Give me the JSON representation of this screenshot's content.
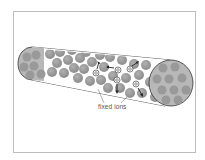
{
  "diagram": {
    "type": "cylindrical pore with fixed ions and mobile ions",
    "label": "fixed ions",
    "colors": {
      "frame_border": "#bdbdbd",
      "sphere_fill": "#9a9a9a",
      "sphere_shade": "#8a8a8a",
      "end_cap_fill": "#b8b8b8",
      "outline": "#333333",
      "ion_marker": "#ffffff",
      "arrow": "#222222",
      "label_text": "#555555"
    },
    "mobile_ions": [
      {
        "x": 96,
        "y": 73,
        "arrow": "up"
      },
      {
        "x": 118,
        "y": 70,
        "arrow": "left"
      },
      {
        "x": 130,
        "y": 69,
        "arrow": "up-right"
      },
      {
        "x": 117,
        "y": 80,
        "arrow": "down"
      },
      {
        "x": 136,
        "y": 84,
        "arrow": "down-right"
      }
    ]
  }
}
